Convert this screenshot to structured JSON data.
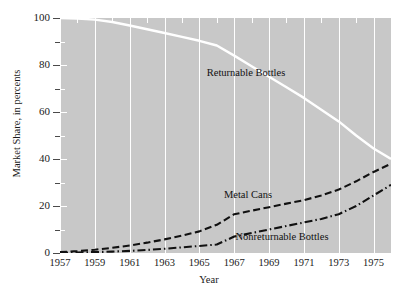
{
  "chart_data": {
    "type": "line",
    "title": "",
    "xlabel": "Year",
    "ylabel": "Market Share, in percents",
    "xlim": [
      1957,
      1976
    ],
    "ylim": [
      0,
      100
    ],
    "grid": true,
    "grid_orientation": "vertical",
    "legend_position": "inline-annotations",
    "panel_color": "#c8c8c8",
    "xticks": [
      1957,
      1959,
      1961,
      1963,
      1965,
      1967,
      1969,
      1971,
      1973,
      1975
    ],
    "xtick_labels": [
      "1957",
      "1959",
      "1961",
      "1963",
      "1965",
      "1967",
      "1969",
      "1971",
      "1973",
      "1975"
    ],
    "yticks": [
      0,
      20,
      40,
      60,
      80,
      100
    ],
    "ytick_labels": [
      "0",
      "20",
      "40",
      "60",
      "80",
      "100"
    ],
    "yminor_ticks": [
      10,
      30,
      50,
      70,
      90
    ],
    "x": [
      1957,
      1958,
      1959,
      1960,
      1961,
      1962,
      1963,
      1964,
      1965,
      1966,
      1967,
      1968,
      1969,
      1970,
      1971,
      1972,
      1973,
      1974,
      1975,
      1976
    ],
    "series": [
      {
        "name": "Returnable Bottles",
        "color": "#ffffff",
        "style": "solid",
        "values": [
          100,
          99.8,
          99.3,
          98.3,
          96.8,
          95.2,
          93.6,
          92.0,
          90.3,
          88.3,
          84.0,
          79.5,
          75.0,
          70.5,
          66.0,
          61.0,
          56.0,
          50.0,
          44.5,
          40.0
        ]
      },
      {
        "name": "Metal Cans",
        "color": "#111111",
        "style": "dashed",
        "values": [
          0.4,
          0.8,
          1.4,
          2.2,
          3.2,
          4.4,
          5.8,
          7.4,
          9.2,
          12.0,
          16.5,
          18.0,
          19.5,
          21.0,
          22.5,
          24.5,
          27.0,
          30.5,
          34.5,
          38.0
        ]
      },
      {
        "name": "Nonreturnable Bottles",
        "color": "#111111",
        "style": "dashdot",
        "values": [
          0.1,
          0.2,
          0.4,
          0.6,
          0.9,
          1.3,
          1.8,
          2.4,
          3.0,
          3.6,
          7.0,
          8.5,
          10.0,
          11.5,
          13.0,
          14.5,
          16.5,
          20.0,
          24.5,
          29.0
        ]
      }
    ],
    "annotations": [
      {
        "text": "Returnable Bottles",
        "x_px": 246,
        "y_px": 68
      },
      {
        "text": "Metal Cans",
        "x_px": 248,
        "y_px": 190
      },
      {
        "text": "Nonreturnable Bottles",
        "x_px": 282,
        "y_px": 232
      }
    ]
  }
}
